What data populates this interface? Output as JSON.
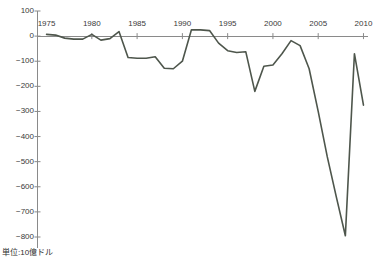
{
  "chart_data": {
    "type": "line",
    "title": "",
    "subtitle": "",
    "xlabel": "",
    "ylabel": "",
    "unit_note": "単位:10億ドル",
    "grid": false,
    "legend": "none",
    "axis_position": {
      "x_axis_at_value": 0,
      "x_tick_labels_position": "top"
    },
    "xlim": [
      1974,
      2010.5
    ],
    "ylim": [
      -800,
      100
    ],
    "yticks": [
      100,
      0,
      -100,
      -200,
      -300,
      -400,
      -500,
      -600,
      -700,
      -800
    ],
    "ytick_labels": [
      "100",
      "0",
      "−100",
      "−200",
      "−300",
      "−400",
      "−500",
      "−600",
      "−700",
      "−800"
    ],
    "xticks": [
      1975,
      1980,
      1985,
      1990,
      1995,
      2000,
      2005,
      2010
    ],
    "xtick_labels": [
      "1975",
      "1980",
      "1985",
      "1990",
      "1995",
      "2000",
      "2005",
      "2010"
    ],
    "series": [
      {
        "name": "balance",
        "color": "#4e564c",
        "x": [
          1975,
          1976,
          1977,
          1978,
          1979,
          1980,
          1981,
          1982,
          1983,
          1984,
          1985,
          1986,
          1987,
          1988,
          1989,
          1990,
          1991,
          1992,
          1993,
          1994,
          1995,
          1996,
          1997,
          1998,
          1999,
          2000,
          2001,
          2002,
          2003,
          2004,
          2005,
          2006,
          2007,
          2008,
          2009,
          2010
        ],
        "values": [
          7,
          4,
          -8,
          -12,
          -12,
          7,
          -16,
          -10,
          18,
          -85,
          -88,
          -88,
          -82,
          -128,
          -130,
          -100,
          25,
          25,
          22,
          -28,
          -58,
          -65,
          -62,
          -220,
          -120,
          -115,
          -70,
          -18,
          -38,
          -130,
          -300,
          -480,
          -640,
          -795,
          -70,
          -275
        ]
      }
    ]
  },
  "axis_colors": {
    "axis_line": "#8a8a8a",
    "line": "#4e564c",
    "text": "#3a3a3a"
  }
}
